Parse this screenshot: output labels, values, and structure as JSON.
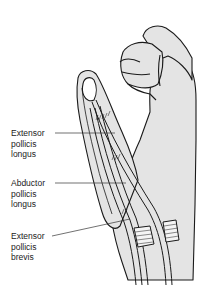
{
  "figure": {
    "colors": {
      "fill": "#e4e4e4",
      "stroke": "#1a1a1a",
      "background": "#ffffff",
      "text": "#222222"
    }
  },
  "labels": [
    {
      "id": "extensor-pollicis-longus",
      "lines": [
        "Extensor",
        "pollicis",
        "longus"
      ],
      "text": "Extensor pollicis longus"
    },
    {
      "id": "abductor-pollicis-longus",
      "lines": [
        "Abductor",
        "pollicis",
        "longus"
      ],
      "text": "Abductor pollicis longus"
    },
    {
      "id": "extensor-pollicis-brevis",
      "lines": [
        "Extensor",
        "pollicis",
        "brevis"
      ],
      "text": "Extensor pollicis brevis"
    }
  ]
}
